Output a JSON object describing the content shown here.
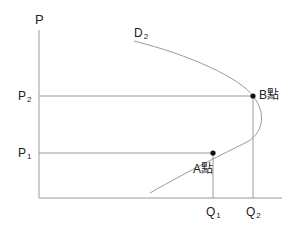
{
  "diagram": {
    "type": "supply-demand-backward-bending",
    "y_axis_label": "P",
    "curve_label": {
      "main": "D",
      "sub": "2"
    },
    "price_levels": [
      {
        "main": "P",
        "sub": "2"
      },
      {
        "main": "P",
        "sub": "1"
      }
    ],
    "quantity_levels": [
      {
        "main": "Q",
        "sub": "1"
      },
      {
        "main": "Q",
        "sub": "2"
      }
    ],
    "points": [
      {
        "label": "B點",
        "price": "P2",
        "quantity": "Q2"
      },
      {
        "label": "A點",
        "price": "P1",
        "quantity": "Q1"
      }
    ],
    "colors": {
      "line": "#9a9a9a",
      "point": "#111111",
      "text": "#222222"
    }
  }
}
